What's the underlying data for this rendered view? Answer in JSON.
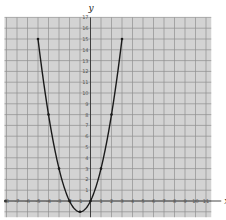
{
  "chart_data": {
    "type": "line",
    "title": "",
    "xlabel": "x",
    "ylabel": "y",
    "xlim": [
      -8,
      11.5
    ],
    "ylim": [
      -1.5,
      17
    ],
    "grid": true,
    "x_ticks": [
      -8,
      -7,
      -6,
      -5,
      -4,
      -3,
      -2,
      -1,
      1,
      2,
      3,
      4,
      5,
      6,
      7,
      8,
      9,
      10,
      11
    ],
    "y_ticks": [
      1,
      2,
      3,
      4,
      5,
      6,
      7,
      8,
      9,
      10,
      11,
      12,
      13,
      14,
      15,
      16,
      17
    ],
    "series": [
      {
        "name": "y = x^2 + 2x",
        "x": [
          -5,
          -4,
          -3,
          -2,
          -1,
          0,
          1,
          2,
          3
        ],
        "y": [
          15,
          8,
          3,
          0,
          -1,
          0,
          3,
          8,
          15
        ]
      }
    ],
    "colors": {
      "grid_bg": "#d3d3d3",
      "grid_line": "#8f8f8f",
      "curve": "#1a1a1a",
      "axis": "#333333"
    }
  }
}
